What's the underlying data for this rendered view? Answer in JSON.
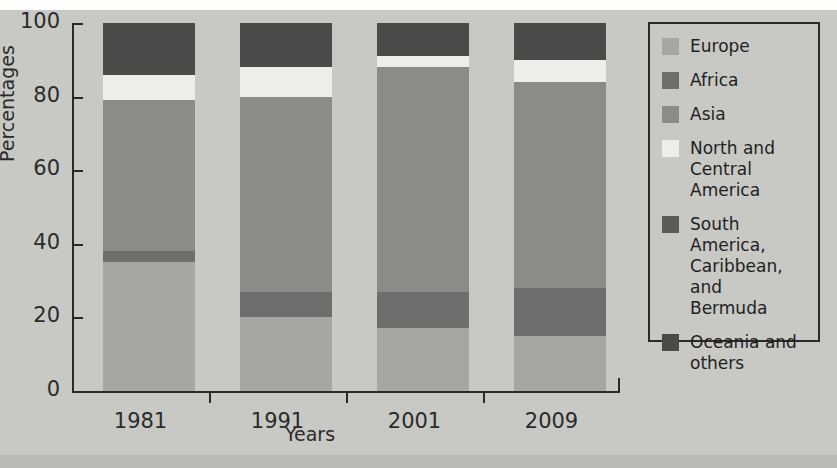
{
  "figure": {
    "background": "#c8c8c4",
    "axis_color": "#2a2a2a"
  },
  "chart_data": {
    "type": "bar",
    "variant": "stacked-vertical-percentage",
    "title": "",
    "xlabel": "Years",
    "ylabel": "Percentages",
    "categories": [
      "1981",
      "1991",
      "2001",
      "2009"
    ],
    "ylim": [
      0,
      100
    ],
    "yticks": [
      0,
      20,
      40,
      60,
      80,
      100
    ],
    "ytick_labels": [
      "0",
      "20",
      "40",
      "60",
      "80",
      "100"
    ],
    "grid": false,
    "legend_position": "right-outside",
    "series": [
      {
        "name": "Europe",
        "color": "#a6a6a2",
        "values": [
          35,
          20,
          17,
          15
        ]
      },
      {
        "name": "Africa",
        "color": "#6e6e6c",
        "values": [
          3,
          7,
          10,
          13
        ]
      },
      {
        "name": "Asia",
        "color": "#8b8b88",
        "values": [
          41,
          53,
          61,
          56
        ]
      },
      {
        "name": "North and\nCentral America",
        "color": "#ededea",
        "values": [
          7,
          8,
          3,
          6
        ]
      },
      {
        "name": "South America,\nCaribbean, and\nBermuda",
        "color": "#5a5a58",
        "values": [
          0,
          0,
          0,
          0
        ]
      },
      {
        "name": "Oceania and\nothers",
        "color": "#4a4a48",
        "values": [
          14,
          12,
          9,
          10
        ]
      }
    ]
  },
  "legend": {
    "items": [
      {
        "label": "Europe",
        "color": "#a6a6a2"
      },
      {
        "label": "Africa",
        "color": "#6e6e6c"
      },
      {
        "label": "Asia",
        "color": "#8b8b88"
      },
      {
        "label": "North and\nCentral America",
        "color": "#ededea"
      },
      {
        "label": "South America,\nCaribbean, and\nBermuda",
        "color": "#5a5a58"
      },
      {
        "label": "Oceania and\nothers",
        "color": "#4a4a48"
      }
    ]
  }
}
